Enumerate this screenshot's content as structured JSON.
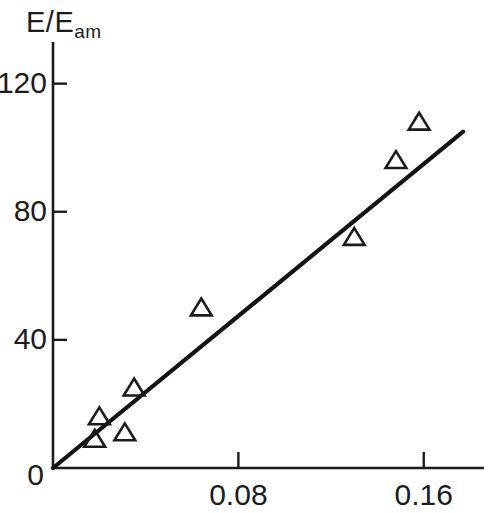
{
  "chart_data": {
    "type": "scatter",
    "title": "",
    "subtitle": "",
    "ylabel": "E/E",
    "ylabel_sub": "am",
    "xlabel": "",
    "xlim": [
      0,
      0.186
    ],
    "ylim": [
      0,
      133
    ],
    "grid": false,
    "legend": null,
    "marker": "open-triangle",
    "x_ticks": [
      {
        "value": 0,
        "label": "0"
      },
      {
        "value": 0.08,
        "label": "0.08"
      },
      {
        "value": 0.16,
        "label": "0.16"
      }
    ],
    "y_ticks": [
      {
        "value": 0,
        "label": "0"
      },
      {
        "value": 40,
        "label": "40"
      },
      {
        "value": 80,
        "label": "80"
      },
      {
        "value": 120,
        "label": "120"
      }
    ],
    "origin_label": "0",
    "series": [
      {
        "name": "data",
        "type": "scatter",
        "marker": "open-triangle",
        "x": [
          0.018,
          0.02,
          0.031,
          0.035,
          0.064,
          0.13,
          0.148,
          0.158
        ],
        "y": [
          9,
          16,
          11,
          25,
          50,
          72,
          96,
          108
        ]
      },
      {
        "name": "fit-line",
        "type": "line",
        "x": [
          0.0,
          0.177
        ],
        "y": [
          0,
          105
        ]
      }
    ],
    "colors": {
      "axis": "#1c1c1c",
      "marker_stroke": "#1c1c1c",
      "marker_fill": "none",
      "line": "#141414",
      "background": "#ffffff"
    }
  },
  "corner": {
    "mark": ""
  }
}
